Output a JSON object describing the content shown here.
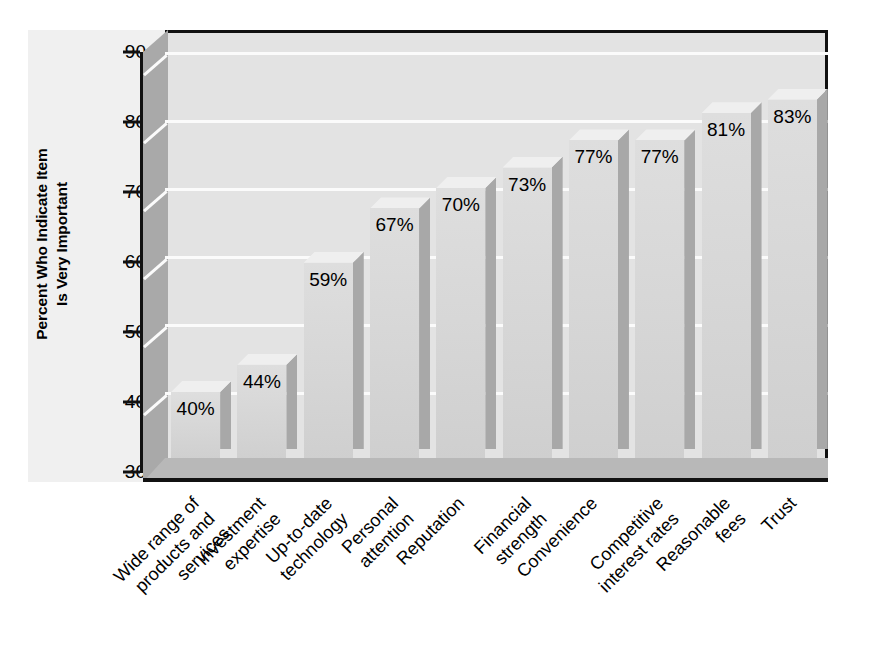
{
  "chart_data": {
    "type": "bar",
    "title": "",
    "subtitle": "",
    "xlabel": "",
    "ylabel": "Percent Who Indicate Item Is Very Important",
    "ylabel_lines": [
      "Percent Who Indicate Item",
      "Is Very Important"
    ],
    "ylim": [
      30,
      90
    ],
    "yticks": [
      30,
      40,
      50,
      60,
      70,
      80,
      90
    ],
    "ytick_labels": [
      "30",
      "40",
      "50",
      "60",
      "70",
      "80",
      "90"
    ],
    "grid": true,
    "grid_color": "#fbfbfb",
    "legend": null,
    "style": "3d-bar",
    "categories": [
      "Wide range of products and services",
      "Investment expertise",
      "Up-to-date technology",
      "Personal attention",
      "Reputation",
      "Financial strength",
      "Convenience",
      "Competitive interest rates",
      "Reasonable fees",
      "Trust"
    ],
    "category_lines": [
      [
        "Wide range of",
        "products and",
        "services"
      ],
      [
        "Investment",
        "expertise"
      ],
      [
        "Up-to-date",
        "technology"
      ],
      [
        "Personal",
        "attention"
      ],
      [
        "Reputation"
      ],
      [
        "Financial",
        "strength"
      ],
      [
        "Convenience"
      ],
      [
        "Competitive",
        "interest rates"
      ],
      [
        "Reasonable",
        "fees"
      ],
      [
        "Trust"
      ]
    ],
    "values": [
      40,
      44,
      59,
      67,
      70,
      73,
      77,
      77,
      81,
      83
    ],
    "value_labels": [
      "40%",
      "44%",
      "59%",
      "67%",
      "70%",
      "73%",
      "77%",
      "77%",
      "81%",
      "83%"
    ],
    "colors": {
      "bar_face": "#d8d8d8",
      "bar_top": "#efefef",
      "bar_side": "#a8a8a8",
      "plot_background": "#e3e3e3",
      "panel_background": "#f0f0f0",
      "axis": "#111111",
      "wall": "#a9a9a9",
      "floor": "#b8b8b8",
      "text": "#000000"
    }
  }
}
